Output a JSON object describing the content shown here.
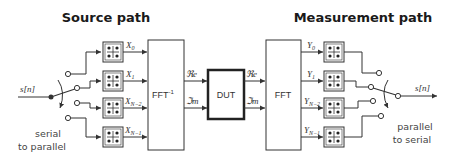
{
  "titles": {
    "source": "Source path",
    "measurement": "Measurement path"
  },
  "source": {
    "input_signal": "s[n]",
    "switch_label_line1": "serial",
    "switch_label_line2": "to parallel",
    "symbols": [
      {
        "name": "X",
        "sub": "0"
      },
      {
        "name": "X",
        "sub": "1"
      },
      {
        "name": "X",
        "sub": "N−2"
      },
      {
        "name": "X",
        "sub": "N−1"
      }
    ],
    "transform_label": "FFT",
    "transform_sup": "-1",
    "outputs": [
      "ℜe",
      "ℑm"
    ]
  },
  "dut": {
    "label": "DUT",
    "inputs": [
      "ℜe",
      "ℑm"
    ]
  },
  "measurement": {
    "transform_label": "FFT",
    "symbols": [
      {
        "name": "Y",
        "sub": "0"
      },
      {
        "name": "Y",
        "sub": "1"
      },
      {
        "name": "Y",
        "sub": "N−2"
      },
      {
        "name": "Y",
        "sub": "N−1"
      }
    ],
    "output_signal": "s[n]",
    "switch_label_line1": "parallel",
    "switch_label_line2": "to serial"
  },
  "colors": {
    "line": "#333333",
    "text": "#333333",
    "background": "#ffffff"
  }
}
